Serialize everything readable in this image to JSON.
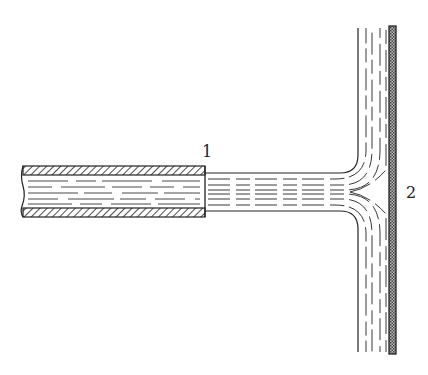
{
  "diagram": {
    "labels": {
      "nozzle_section": "1",
      "wall": "2"
    },
    "colors": {
      "line": "#222222",
      "background": "#ffffff"
    }
  }
}
